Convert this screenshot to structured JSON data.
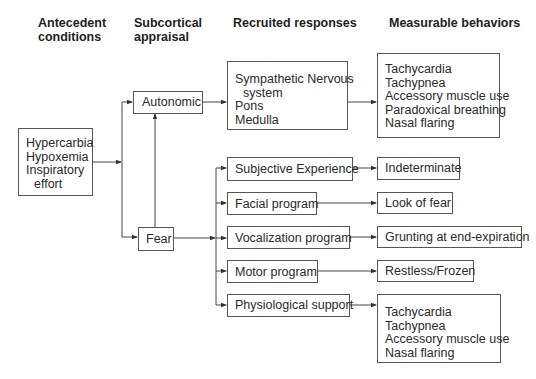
{
  "headers": {
    "antecedent": [
      "Antecedent",
      "conditions"
    ],
    "subcortical": [
      "Subcortical",
      "appraisal"
    ],
    "recruited": "Recruited responses",
    "measurable": "Measurable behaviors"
  },
  "antecedent_box": {
    "lines": [
      "Hypercarbia",
      "Hypoxemia",
      "Inspiratory",
      "effort"
    ]
  },
  "appraisal": {
    "autonomic": "Autonomic",
    "fear": "Fear"
  },
  "recruited": {
    "sympathetic": [
      "Sympathetic Nervous",
      "system",
      "Pons",
      "Medulla"
    ],
    "subjective": "Subjective Experience",
    "facial": "Facial program",
    "vocalization": "Vocalization program",
    "motor": "Motor program",
    "physiological": "Physiological support"
  },
  "behaviors": {
    "autonomic_behaviors": [
      "Tachycardia",
      "Tachypnea",
      "Accessory muscle use",
      "Paradoxical breathing",
      "Nasal flaring"
    ],
    "subjective": "Indeterminate",
    "facial": "Look of fear",
    "vocalization": "Grunting at end-expiration",
    "motor": "Restless/Frozen",
    "physiological_behaviors": [
      "Tachycardia",
      "Tachypnea",
      "Accessory muscle use",
      "Nasal flaring"
    ]
  }
}
